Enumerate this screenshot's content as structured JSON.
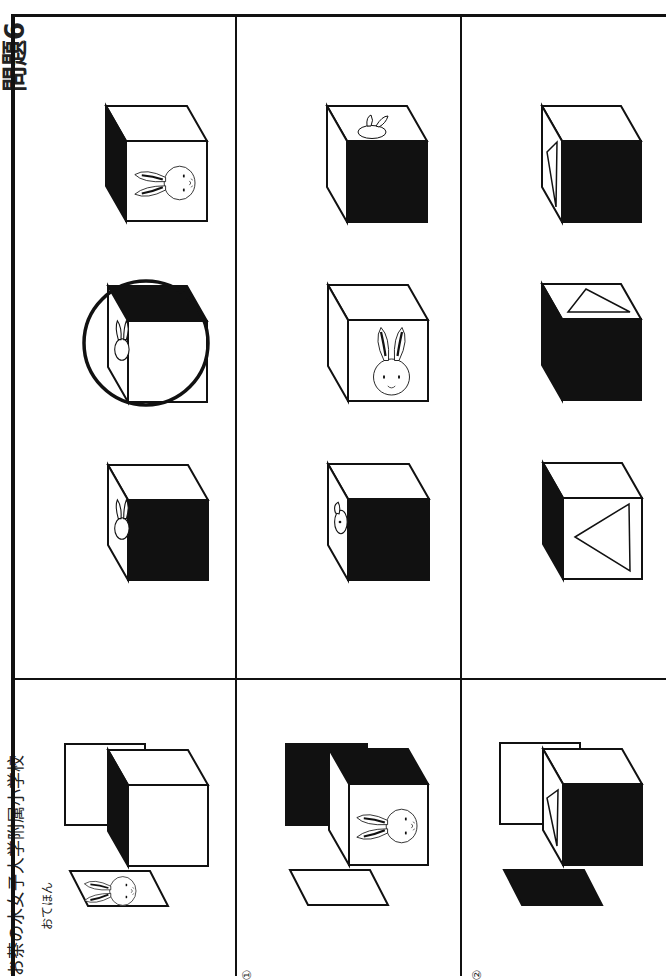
{
  "page": {
    "title_fragment": "問題6",
    "school_name": "お茶の水女子大学附属小学校",
    "orientation": "rotated 90° counter-clockwise"
  },
  "example_row": {
    "label": "おてほん",
    "description": "A cube with a dark left face and a separate card with a rabbit shown beside it, and a square card behind it",
    "answer_options": [
      {
        "id": "example-1",
        "front_face": "rabbit (sideways)",
        "top_face": "white",
        "left_face": "black"
      },
      {
        "id": "example-2",
        "front_face": "white",
        "top_face": "black",
        "left_face": "rabbit (sideways)",
        "circled": true
      },
      {
        "id": "example-3",
        "front_face": "black",
        "top_face": "white",
        "left_face": "rabbit (sideways)"
      }
    ]
  },
  "question_rows": [
    {
      "number": "①",
      "parts": {
        "back_card": "black",
        "cube_front": "rabbit (sideways)",
        "cube_top": "black",
        "cube_left": "white",
        "bottom_card": "white"
      },
      "answer_options": [
        {
          "id": "q1-1",
          "front_face": "black",
          "top_face": "rabbit",
          "left_face": "white"
        },
        {
          "id": "q1-2",
          "front_face": "rabbit (upright)",
          "top_face": "white",
          "left_face": "white"
        },
        {
          "id": "q1-3",
          "front_face": "black",
          "top_face": "white",
          "left_face": "rabbit (sideways)"
        }
      ]
    },
    {
      "number": "②",
      "parts": {
        "back_card": "white",
        "cube_front": "black",
        "cube_top": "white",
        "cube_left": "triangle",
        "bottom_card": "black"
      },
      "answer_options": [
        {
          "id": "q2-1",
          "front_face": "black",
          "top_face": "white",
          "left_face": "triangle"
        },
        {
          "id": "q2-2",
          "front_face": "black",
          "top_face": "triangle",
          "left_face": "black"
        },
        {
          "id": "q2-3",
          "front_face": "triangle",
          "top_face": "white",
          "left_face": "black"
        }
      ]
    }
  ],
  "colors": {
    "ink": "#111111",
    "paper": "#ffffff",
    "circle_mark": "#111111"
  }
}
